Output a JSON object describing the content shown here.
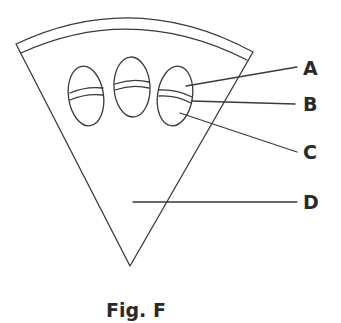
{
  "figure": {
    "caption": "Fig. F",
    "colors": {
      "stroke": "#3a3a3a",
      "text": "#2a2a2a",
      "background": "#ffffff"
    },
    "labels": [
      {
        "id": "A",
        "text": "A"
      },
      {
        "id": "B",
        "text": "B"
      },
      {
        "id": "C",
        "text": "C"
      },
      {
        "id": "D",
        "text": "D"
      }
    ],
    "parts": {
      "wedge": "sector-shaped slice with a curved outer rim band",
      "ovals": 3,
      "oval_band": "thin curved band across each oval"
    }
  }
}
